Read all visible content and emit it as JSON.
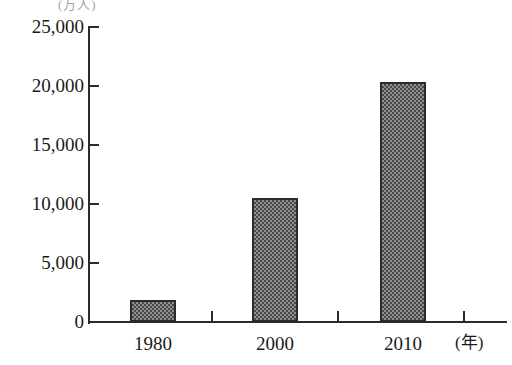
{
  "chart_data": {
    "type": "bar",
    "title": "",
    "top_unit_label": "(万人)",
    "categories": [
      "1980",
      "2000",
      "2010"
    ],
    "values": [
      1900,
      10500,
      20300
    ],
    "xlabel": "(年)",
    "ylabel": "",
    "ylim": [
      0,
      25000
    ],
    "ytick_labels": [
      "0",
      "5,000",
      "10,000",
      "15,000",
      "20,000",
      "25,000"
    ],
    "ytick_values": [
      0,
      5000,
      10000,
      15000,
      20000,
      25000
    ],
    "grid": false,
    "legend": "none",
    "bar_fill": "#8f8f8f",
    "bar_pattern": "checkerboard-stipple",
    "bar_border": "#2b2b2b",
    "axis_color": "#2b2b2b"
  }
}
